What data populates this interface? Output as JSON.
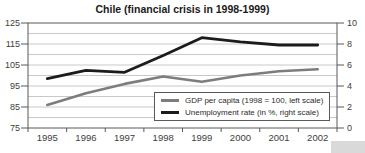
{
  "chart_data": {
    "type": "line",
    "title": "Chile (financial crisis in 1998-1999)",
    "x": [
      "1995",
      "1996",
      "1997",
      "1998",
      "1999",
      "2000",
      "2001",
      "2002"
    ],
    "series": [
      {
        "name": "GDP per capita (1998 = 100, left scale)",
        "axis": "left",
        "color": "#7d7d7d",
        "stroke_width": 2.6,
        "values": [
          86,
          91.5,
          96,
          99.5,
          97,
          100,
          102,
          103
        ]
      },
      {
        "name": "Unemployment rate (in %, right scale)",
        "axis": "right",
        "color": "#1c1c1c",
        "stroke_width": 2.8,
        "values": [
          4.7,
          5.5,
          5.3,
          6.9,
          8.6,
          8.2,
          7.9,
          7.9
        ]
      }
    ],
    "left_axis": {
      "min": 75,
      "max": 125,
      "ticks": [
        125,
        115,
        105,
        95,
        85,
        75
      ]
    },
    "right_axis": {
      "min": 0,
      "max": 10,
      "ticks": [
        10,
        8,
        6,
        4,
        2,
        0
      ]
    },
    "gridline_step_left_units": 5,
    "grid": true,
    "legend_position": "inside-bottom-right",
    "colors": {
      "gridline": "#c9c9c9",
      "plot_border": "#595959",
      "tick": "#595959",
      "label_text": "#3d3d3d"
    }
  }
}
